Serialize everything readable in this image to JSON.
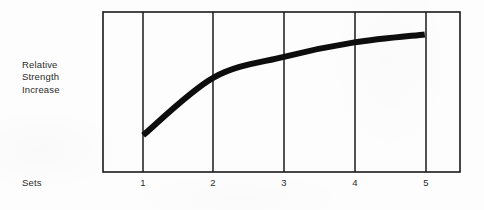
{
  "chart_data": {
    "type": "line",
    "title": "",
    "xlabel": "Sets",
    "ylabel": "Relative Strength Increase",
    "ylabel_lines": [
      "Relative",
      "Strength",
      "Increase"
    ],
    "x": [
      1,
      2,
      3,
      4,
      5
    ],
    "categories": [
      "1",
      "2",
      "3",
      "4",
      "5"
    ],
    "tick_labels": [
      "1",
      "2",
      "3",
      "4",
      "5"
    ],
    "series": [
      {
        "name": "Relative Strength Increase",
        "values": [
          0.23,
          0.59,
          0.72,
          0.81,
          0.86
        ],
        "color": "#0d0d0d"
      }
    ],
    "xlim": [
      0.43,
      5.5
    ],
    "ylim": [
      0,
      1
    ],
    "grid": "vertical-only",
    "y_axis_ticks_shown": false,
    "legend": "none",
    "annotation": "Diminishing returns curve: strength increase rises steeply from set 1 to set 2, then flattens toward set 5.",
    "line_style": "thick-solid",
    "line_width_px": 6
  },
  "figure": {
    "frame_color": "#1a1a1a",
    "gridline_color": "#1a1a1a",
    "curve_color": "#0d0d0d",
    "background_color": "#fdfdfd",
    "text_color": "#2b2b2b"
  },
  "axes": {
    "y": {
      "label_line_1": "Relative",
      "label_line_2": "Strength",
      "label_line_3": "Increase"
    },
    "x": {
      "label": "Sets"
    }
  }
}
